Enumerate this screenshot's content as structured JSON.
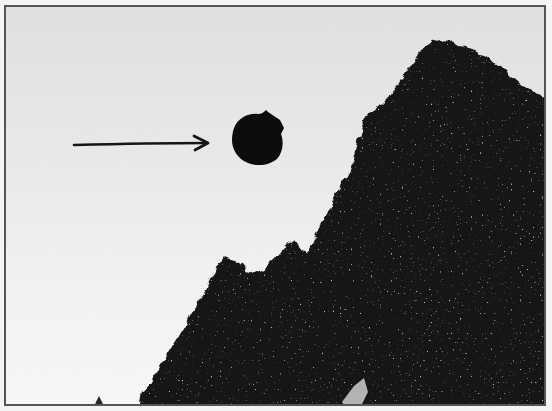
{
  "photo": {
    "subject": "dark round object in sky",
    "description": "Black-and-white photograph of a dark round object in the sky indicated by a hand-drawn arrow, with trees silhouetted on the right and bottom",
    "colors": {
      "sky_top": "#e2e2e2",
      "sky_bottom": "#fafafa",
      "foliage": "#161616",
      "object": "#0c0c0c",
      "arrow": "#151515",
      "frame_border": "#555555"
    },
    "arrow": {
      "from": [
        72,
        143
      ],
      "to": [
        207,
        141
      ],
      "direction": "right"
    },
    "object": {
      "center": [
        256,
        137
      ],
      "radius": 26
    }
  }
}
